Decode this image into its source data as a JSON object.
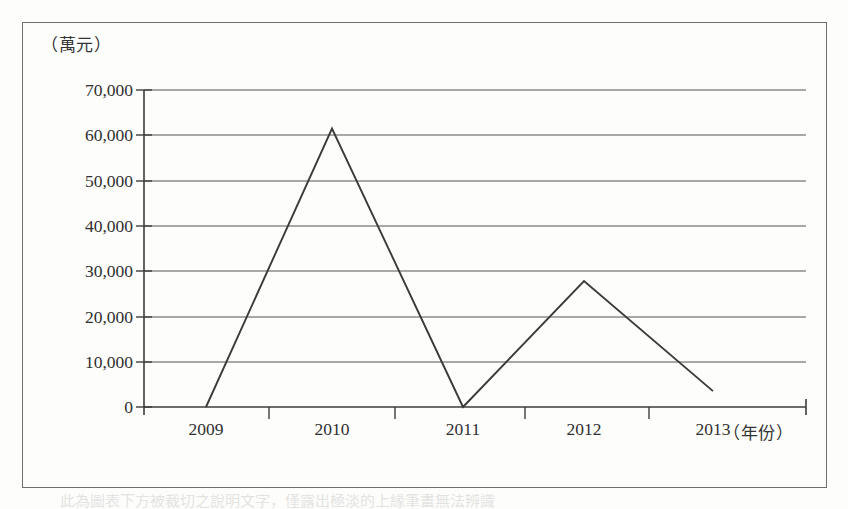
{
  "figure": {
    "y_axis_unit_label": "（萬元）",
    "x_axis_unit_label": "（年份）",
    "caption_partial": "此為圖表下方被裁切之說明文字，僅露出極淡的上緣筆畫無法辨識"
  },
  "chart_data": {
    "type": "line",
    "title": "",
    "xlabel": "（年份）",
    "ylabel": "（萬元）",
    "categories": [
      "2009",
      "2010",
      "2011",
      "2012",
      "2013"
    ],
    "values": [
      0,
      61500,
      0,
      27800,
      3500
    ],
    "series": [
      {
        "name": "",
        "values": [
          0,
          61500,
          0,
          27800,
          3500
        ]
      }
    ],
    "ylim": [
      0,
      70000
    ],
    "ytick_labels": [
      "70,000",
      "60,000",
      "50,000",
      "40,000",
      "30,000",
      "20,000",
      "10,000",
      "0"
    ],
    "ytick_values": [
      70000,
      60000,
      50000,
      40000,
      30000,
      20000,
      10000,
      0
    ],
    "xtick_labels": [
      "2009",
      "2010",
      "2011",
      "2012",
      "2013"
    ],
    "grid": true,
    "grid_axis": "y",
    "legend": false,
    "legend_position": "none",
    "markers": false,
    "line_color": "#3a3a3a",
    "grid_color": "#555555",
    "axis_color": "#4a4a4a",
    "background_color": "#fdfdfb"
  }
}
